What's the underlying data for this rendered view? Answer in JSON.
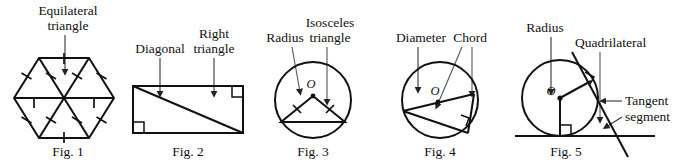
{
  "document": {
    "title": "Geometry figures: Fig. 1 through Fig. 5",
    "background_color": "#ffffff",
    "ink_color": "#111111"
  },
  "figures": [
    {
      "id": "fig-1",
      "caption": "Fig. 1",
      "shape": "regular hexagon divided into six equilateral triangles by three main diagonals",
      "labels": [
        {
          "name": "equilateral-triangle-label",
          "line1": "Equilateral",
          "line2": "triangle"
        }
      ],
      "center_label": "",
      "tick_marks": "single tick on every hexagon side and every radius segment"
    },
    {
      "id": "fig-2",
      "caption": "Fig. 2",
      "shape": "rectangle with one diagonal drawn from top-left to bottom-right forming two right triangles",
      "labels": [
        {
          "name": "diagonal-label",
          "line1": "Diagonal",
          "line2": ""
        },
        {
          "name": "right-triangle-label",
          "line1": "Right",
          "line2": "triangle"
        }
      ],
      "center_label": "",
      "right_angle_marks": 2
    },
    {
      "id": "fig-3",
      "caption": "Fig. 3",
      "shape": "circle with center O and an inscribed isosceles triangle formed by two radii and a chord",
      "labels": [
        {
          "name": "radius-label",
          "line1": "Radius",
          "line2": ""
        },
        {
          "name": "isosceles-triangle-label",
          "line1": "Isosceles",
          "line2": "triangle"
        }
      ],
      "center_label": "O",
      "tick_marks": "one tick on each of the two equal radii"
    },
    {
      "id": "fig-4",
      "caption": "Fig. 4",
      "shape": "circle with center O showing a diameter and a chord meeting at a right angle on the circle",
      "labels": [
        {
          "name": "diameter-label",
          "line1": "Diameter",
          "line2": ""
        },
        {
          "name": "chord-label",
          "line1": "Chord",
          "line2": ""
        }
      ],
      "center_label": "O",
      "right_angle_marks": 1
    },
    {
      "id": "fig-5",
      "caption": "Fig. 5",
      "shape": "circle with center O, two tangent lines, radii to the points of tangency forming a quadrilateral",
      "labels": [
        {
          "name": "radius-label",
          "line1": "Radius",
          "line2": ""
        },
        {
          "name": "quadrilateral-label",
          "line1": "Quadrilateral",
          "line2": ""
        },
        {
          "name": "tangent-segment-label",
          "line1": "Tangent",
          "line2": "segment"
        }
      ],
      "center_label": "O",
      "right_angle_marks": 2
    }
  ],
  "captions": {
    "fig1": "Fig. 1",
    "fig2": "Fig. 2",
    "fig3": "Fig. 3",
    "fig4": "Fig. 4",
    "fig5": "Fig. 5"
  },
  "annotations": {
    "equilateral_l1": "Equilateral",
    "equilateral_l2": "triangle",
    "diagonal": "Diagonal",
    "right_l1": "Right",
    "right_l2": "triangle",
    "radius3": "Radius",
    "isosceles_l1": "Isosceles",
    "isosceles_l2": "triangle",
    "diameter": "Diameter",
    "chord": "Chord",
    "radius5": "Radius",
    "quadrilateral": "Quadrilateral",
    "tangent_l1": "Tangent",
    "tangent_l2": "segment",
    "center_o_fig3": "O",
    "center_o_fig4": "O",
    "center_o_fig5": "O"
  }
}
